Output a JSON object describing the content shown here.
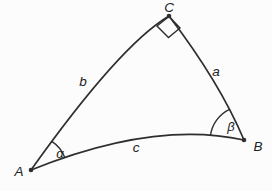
{
  "figure": {
    "background_color": "#fcfcfc",
    "line_color": "#2e2e2e",
    "text_color": "#222222",
    "vertices": {
      "A": "A",
      "B": "B",
      "C": "C"
    },
    "sides": {
      "a": "a",
      "b": "b",
      "c": "c"
    },
    "angles": {
      "alpha": "α",
      "beta": "β"
    }
  }
}
